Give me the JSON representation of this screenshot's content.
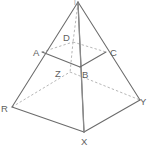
{
  "figure": {
    "shape_name": "square-pyramid",
    "stroke_colors": {
      "solid_edge": "#6b6b6b",
      "axis": "#8a8a8a",
      "hidden_edge": "#a9a9a9",
      "label": "#5e5e5e",
      "background": "#ffffff"
    },
    "canvas": {
      "width": 149,
      "height": 147
    }
  },
  "vertices": [
    {
      "id": "apex",
      "label": "T",
      "x": 78,
      "y": 3,
      "label_x": 76,
      "label_y": 3,
      "hidden": false,
      "clipped": true,
      "label_visible": false
    },
    {
      "id": "A",
      "label": "A",
      "x": 42,
      "y": 52,
      "label_x": 33,
      "label_y": 55,
      "hidden": false,
      "clipped": false,
      "label_visible": true
    },
    {
      "id": "B",
      "label": "B",
      "x": 80,
      "y": 67,
      "label_x": 84,
      "label_y": 76,
      "hidden": false,
      "clipped": false,
      "label_visible": true
    },
    {
      "id": "C",
      "label": "C",
      "x": 106,
      "y": 52,
      "label_x": 110,
      "label_y": 55,
      "hidden": false,
      "clipped": false,
      "label_visible": true
    },
    {
      "id": "D",
      "label": "D",
      "x": 73,
      "y": 42,
      "label_x": 64,
      "label_y": 40,
      "hidden": true,
      "clipped": false,
      "label_visible": true
    },
    {
      "id": "R",
      "label": "R",
      "x": 12,
      "y": 107,
      "label_x": 2,
      "label_y": 112,
      "hidden": false,
      "clipped": false,
      "label_visible": true
    },
    {
      "id": "X",
      "label": "X",
      "x": 84,
      "y": 132,
      "label_x": 80,
      "label_y": 145,
      "hidden": false,
      "clipped": false,
      "label_visible": true
    },
    {
      "id": "Y",
      "label": "Y",
      "x": 140,
      "y": 100,
      "label_x": 142,
      "label_y": 105,
      "hidden": false,
      "clipped": false,
      "label_visible": true
    },
    {
      "id": "Z",
      "label": "Z",
      "x": 70,
      "y": 72,
      "label_x": 57,
      "label_y": 76,
      "hidden": true,
      "clipped": false,
      "label_visible": true
    }
  ],
  "edges": [
    {
      "id": "apex-R",
      "from": "apex",
      "to": "R",
      "style": "solid"
    },
    {
      "id": "apex-X",
      "from": "apex",
      "to": "X",
      "style": "solid"
    },
    {
      "id": "apex-Y",
      "from": "apex",
      "to": "Y",
      "style": "solid"
    },
    {
      "id": "axis",
      "from": "apex",
      "to": "X",
      "style": "axis"
    },
    {
      "id": "R-X",
      "from": "R",
      "to": "X",
      "style": "solid"
    },
    {
      "id": "X-Y",
      "from": "X",
      "to": "Y",
      "style": "solid"
    },
    {
      "id": "R-Z",
      "from": "R",
      "to": "Z",
      "style": "dashed"
    },
    {
      "id": "Z-Y",
      "from": "Z",
      "to": "Y",
      "style": "dashed"
    },
    {
      "id": "A-B",
      "from": "A",
      "to": "B",
      "style": "solid"
    },
    {
      "id": "B-C",
      "from": "B",
      "to": "C",
      "style": "solid"
    },
    {
      "id": "A-D",
      "from": "A",
      "to": "D",
      "style": "dashed"
    },
    {
      "id": "D-C",
      "from": "D",
      "to": "C",
      "style": "dashed"
    },
    {
      "id": "D-Z",
      "from": "D",
      "to": "Z",
      "style": "dashed"
    },
    {
      "id": "B-X",
      "from": "B",
      "to": "X",
      "style": "axis"
    }
  ],
  "labels": {
    "apex": "T",
    "A": "A",
    "B": "B",
    "C": "C",
    "D": "D",
    "R": "R",
    "X": "X",
    "Y": "Y",
    "Z": "Z"
  }
}
